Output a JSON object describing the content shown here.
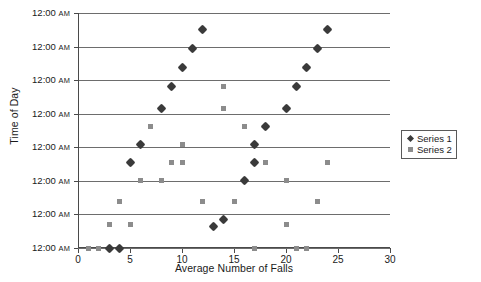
{
  "chart_data": {
    "type": "scatter",
    "title": "",
    "xlabel": "Average Number of Falls",
    "ylabel": "Time of Day",
    "xlim": [
      0,
      30
    ],
    "xticks": [
      0,
      5,
      10,
      15,
      20,
      25,
      30
    ],
    "xtick_labels": [
      "0",
      "5",
      "10",
      "15",
      "20",
      "25",
      "30"
    ],
    "ylim": [
      0,
      11
    ],
    "yticks": [
      0,
      1.571,
      3.143,
      4.714,
      6.286,
      7.857,
      9.429,
      11
    ],
    "ytick_labels": [
      "12:00 AM",
      "12:00 AM",
      "12:00 AM",
      "12:00 AM",
      "12:00 AM",
      "12:00 AM",
      "12:00 AM",
      "12:00 AM"
    ],
    "ytick_time": "12:00",
    "ytick_meridiem": "AM",
    "grid": true,
    "grid_axis": "y",
    "legend_position": "right",
    "series": [
      {
        "name": "Series 1",
        "marker": "diamond",
        "color": "#3a3a3a",
        "points": [
          [
            3,
            0
          ],
          [
            4,
            0
          ],
          [
            13,
            1
          ],
          [
            14,
            1.35
          ],
          [
            16,
            3.15
          ],
          [
            5,
            4
          ],
          [
            17,
            4
          ],
          [
            6,
            4.85
          ],
          [
            17,
            4.85
          ],
          [
            18,
            5.7
          ],
          [
            8,
            6.55
          ],
          [
            20,
            6.55
          ],
          [
            9,
            7.55
          ],
          [
            21,
            7.55
          ],
          [
            10,
            8.45
          ],
          [
            22,
            8.45
          ],
          [
            11,
            9.35
          ],
          [
            23,
            9.35
          ],
          [
            12,
            10.25
          ],
          [
            24,
            10.25
          ]
        ]
      },
      {
        "name": "Series 2",
        "marker": "square",
        "color": "#8c8c8c",
        "points": [
          [
            1,
            0
          ],
          [
            2,
            0
          ],
          [
            17,
            0
          ],
          [
            21,
            0
          ],
          [
            22,
            0
          ],
          [
            3,
            1.1
          ],
          [
            5,
            1.1
          ],
          [
            20,
            1.1
          ],
          [
            4,
            2.2
          ],
          [
            12,
            2.2
          ],
          [
            15,
            2.2
          ],
          [
            23,
            2.2
          ],
          [
            6,
            3.15
          ],
          [
            8,
            3.15
          ],
          [
            20,
            3.15
          ],
          [
            9,
            4
          ],
          [
            10,
            4
          ],
          [
            18,
            4
          ],
          [
            24,
            4
          ],
          [
            10,
            4.85
          ],
          [
            7,
            5.7
          ],
          [
            16,
            5.7
          ],
          [
            14,
            6.55
          ],
          [
            14,
            7.55
          ]
        ]
      }
    ]
  },
  "legend": {
    "items": [
      {
        "label": "Series 1"
      },
      {
        "label": "Series 2"
      }
    ]
  },
  "axes": {
    "x_title": "Average Number of Falls",
    "y_title": "Time of Day"
  }
}
